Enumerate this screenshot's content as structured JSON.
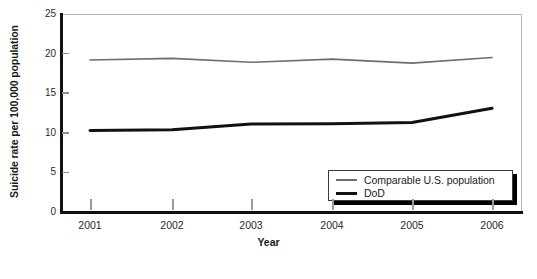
{
  "chart_data": {
    "type": "line",
    "title": "",
    "xlabel": "Year",
    "ylabel": "Suicide rate per 100,000 population",
    "categories": [
      "2001",
      "2002",
      "2003",
      "2004",
      "2005",
      "2006"
    ],
    "x": [
      2001,
      2002,
      2003,
      2004,
      2005,
      2006
    ],
    "ylim": [
      0,
      25
    ],
    "yticks": [
      0,
      5,
      10,
      15,
      20,
      25
    ],
    "ytick_labels": [
      "0",
      "5",
      "10",
      "15",
      "20",
      "25"
    ],
    "grid": false,
    "legend_position": "lower right",
    "series": [
      {
        "name": "Comparable U.S. population",
        "color": "#6e6e6e",
        "line_width": 1.6,
        "values": [
          19.2,
          19.4,
          18.9,
          19.3,
          18.8,
          19.5
        ]
      },
      {
        "name": "DoD",
        "color": "#111111",
        "line_width": 3,
        "values": [
          10.3,
          10.4,
          11.1,
          11.15,
          11.3,
          13.1
        ]
      }
    ]
  },
  "axes": {
    "ylabel": "Suicide rate per 100,000 population",
    "xlabel": "Year"
  },
  "legend": {
    "items": [
      {
        "label": "Comparable U.S. population",
        "swatch": "thin-gray-line"
      },
      {
        "label": "DoD",
        "swatch": "thick-black-line"
      }
    ]
  },
  "caption": {
    "text": ""
  }
}
